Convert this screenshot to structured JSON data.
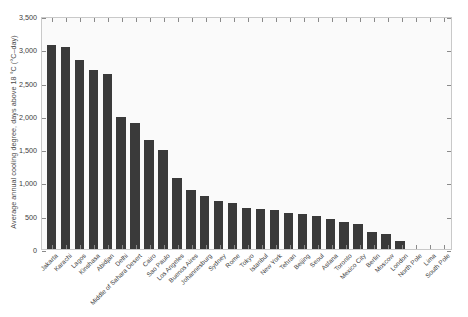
{
  "chart_data": {
    "type": "bar",
    "title": "",
    "xlabel": "",
    "ylabel": "Average annual cooling degree, days above 18 °C (°C–day)",
    "ylim": [
      0,
      3500
    ],
    "ytick_values": [
      0,
      500,
      1000,
      1500,
      2000,
      2500,
      3000,
      3500
    ],
    "ytick_labels": [
      "0",
      "500",
      "1,000",
      "1,500",
      "2,000",
      "2,500",
      "3,000",
      "3,500"
    ],
    "grid": false,
    "legend": null,
    "bar_color": "#3a3a3a",
    "plot_bg": "#fafafa",
    "categories": [
      "Jakarta",
      "Karachi",
      "Lagos",
      "Kinshasa",
      "Abidjan",
      "Delhi",
      "Middle of Sahara Desert",
      "Cairo",
      "Sao Paulo",
      "Los Angeles",
      "Buenos Aires",
      "Johannesburg",
      "Sydney",
      "Rome",
      "Tokyo",
      "Istanbul",
      "New York",
      "Tehran",
      "Beijing",
      "Seoul",
      "Astana",
      "Toronto",
      "Mexico City",
      "Berlin",
      "Moscow",
      "London",
      "North Pole",
      "Lima",
      "South Pole"
    ],
    "values": [
      3070,
      3030,
      2840,
      2690,
      2630,
      1990,
      1890,
      1640,
      1480,
      1060,
      880,
      790,
      720,
      690,
      620,
      600,
      590,
      540,
      520,
      490,
      450,
      400,
      380,
      260,
      230,
      120,
      0,
      0,
      0
    ]
  }
}
